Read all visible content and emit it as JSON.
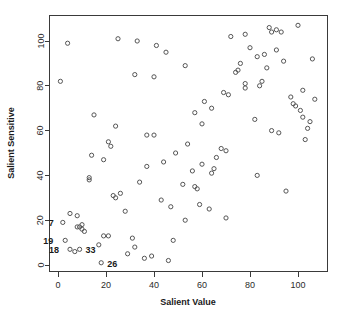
{
  "chart_data": {
    "type": "scatter",
    "title": "",
    "xlabel": "Salient Value",
    "ylabel": "Salient Sensitive",
    "xlim": [
      -4,
      112
    ],
    "ylim": [
      -4,
      112
    ],
    "xticks": [
      0,
      20,
      40,
      60,
      80,
      100
    ],
    "yticks": [
      0,
      20,
      40,
      60,
      80,
      100
    ],
    "xtick_labels": [
      "0",
      "20",
      "40",
      "60",
      "80",
      "100"
    ],
    "ytick_labels": [
      "0",
      "20",
      "40",
      "60",
      "80",
      "100"
    ],
    "grid": false,
    "legend": null,
    "marker": "open-circle",
    "marker_color": "#555555",
    "background_color": "#ffffff",
    "axis_color": "#3a3a3a",
    "points": [
      {
        "x": 1,
        "y": 82
      },
      {
        "x": 4,
        "y": 99
      },
      {
        "x": 2,
        "y": 19
      },
      {
        "x": 5,
        "y": 23
      },
      {
        "x": 8,
        "y": 22
      },
      {
        "x": 8,
        "y": 17
      },
      {
        "x": 9,
        "y": 17
      },
      {
        "x": 10,
        "y": 18
      },
      {
        "x": 10,
        "y": 16
      },
      {
        "x": 11,
        "y": 15
      },
      {
        "x": 3,
        "y": 11
      },
      {
        "x": 5,
        "y": 7
      },
      {
        "x": 7,
        "y": 6
      },
      {
        "x": 9,
        "y": 7
      },
      {
        "x": 14,
        "y": 49
      },
      {
        "x": 13,
        "y": 39
      },
      {
        "x": 13,
        "y": 38
      },
      {
        "x": 15,
        "y": 67
      },
      {
        "x": 17,
        "y": 9
      },
      {
        "x": 18,
        "y": 1
      },
      {
        "x": 19,
        "y": 47
      },
      {
        "x": 19,
        "y": 13
      },
      {
        "x": 21,
        "y": 13
      },
      {
        "x": 21,
        "y": 55
      },
      {
        "x": 22,
        "y": 53
      },
      {
        "x": 23,
        "y": 31
      },
      {
        "x": 24,
        "y": 30
      },
      {
        "x": 24,
        "y": 62
      },
      {
        "x": 25,
        "y": 101
      },
      {
        "x": 26,
        "y": 32
      },
      {
        "x": 28,
        "y": 24
      },
      {
        "x": 29,
        "y": 5
      },
      {
        "x": 31,
        "y": 12
      },
      {
        "x": 32,
        "y": 8
      },
      {
        "x": 32,
        "y": 85
      },
      {
        "x": 33,
        "y": 100
      },
      {
        "x": 34,
        "y": 37
      },
      {
        "x": 36,
        "y": 3
      },
      {
        "x": 37,
        "y": 58
      },
      {
        "x": 37,
        "y": 44
      },
      {
        "x": 39,
        "y": 4
      },
      {
        "x": 40,
        "y": 58
      },
      {
        "x": 40,
        "y": 84
      },
      {
        "x": 41,
        "y": 98
      },
      {
        "x": 43,
        "y": 29
      },
      {
        "x": 44,
        "y": 46
      },
      {
        "x": 45,
        "y": 95
      },
      {
        "x": 46,
        "y": 2
      },
      {
        "x": 47,
        "y": 26
      },
      {
        "x": 48,
        "y": 11
      },
      {
        "x": 49,
        "y": 50
      },
      {
        "x": 52,
        "y": 36
      },
      {
        "x": 53,
        "y": 20
      },
      {
        "x": 53,
        "y": 89
      },
      {
        "x": 54,
        "y": 54
      },
      {
        "x": 56,
        "y": 42
      },
      {
        "x": 57,
        "y": 35
      },
      {
        "x": 58,
        "y": 34
      },
      {
        "x": 57,
        "y": 68
      },
      {
        "x": 59,
        "y": 27
      },
      {
        "x": 60,
        "y": 63
      },
      {
        "x": 60,
        "y": 45
      },
      {
        "x": 61,
        "y": 73
      },
      {
        "x": 63,
        "y": 25
      },
      {
        "x": 64,
        "y": 41
      },
      {
        "x": 64,
        "y": 70
      },
      {
        "x": 65,
        "y": 43
      },
      {
        "x": 66,
        "y": 48
      },
      {
        "x": 68,
        "y": 52
      },
      {
        "x": 69,
        "y": 77
      },
      {
        "x": 70,
        "y": 21
      },
      {
        "x": 70,
        "y": 51
      },
      {
        "x": 71,
        "y": 76
      },
      {
        "x": 72,
        "y": 102
      },
      {
        "x": 74,
        "y": 86
      },
      {
        "x": 75,
        "y": 87
      },
      {
        "x": 76,
        "y": 90
      },
      {
        "x": 78,
        "y": 103
      },
      {
        "x": 78,
        "y": 81
      },
      {
        "x": 78,
        "y": 79
      },
      {
        "x": 80,
        "y": 97
      },
      {
        "x": 82,
        "y": 65
      },
      {
        "x": 83,
        "y": 40
      },
      {
        "x": 83,
        "y": 93
      },
      {
        "x": 84,
        "y": 80
      },
      {
        "x": 85,
        "y": 82
      },
      {
        "x": 86,
        "y": 94
      },
      {
        "x": 87,
        "y": 88
      },
      {
        "x": 88,
        "y": 106
      },
      {
        "x": 89,
        "y": 104
      },
      {
        "x": 89,
        "y": 60
      },
      {
        "x": 91,
        "y": 105
      },
      {
        "x": 91,
        "y": 96
      },
      {
        "x": 92,
        "y": 59
      },
      {
        "x": 93,
        "y": 104
      },
      {
        "x": 94,
        "y": 91
      },
      {
        "x": 95,
        "y": 33
      },
      {
        "x": 97,
        "y": 75
      },
      {
        "x": 98,
        "y": 72
      },
      {
        "x": 99,
        "y": 71
      },
      {
        "x": 100,
        "y": 107
      },
      {
        "x": 101,
        "y": 69
      },
      {
        "x": 102,
        "y": 78
      },
      {
        "x": 102,
        "y": 66
      },
      {
        "x": 103,
        "y": 56
      },
      {
        "x": 104,
        "y": 61
      },
      {
        "x": 105,
        "y": 64
      },
      {
        "x": 106,
        "y": 92
      },
      {
        "x": 107,
        "y": 74
      }
    ],
    "point_labels": [
      {
        "text": "7",
        "x": 2,
        "y": 19,
        "dx": -9,
        "dy": 1
      },
      {
        "text": "19",
        "x": 3,
        "y": 11,
        "dx": -12,
        "dy": 1
      },
      {
        "text": "18",
        "x": 5,
        "y": 7,
        "dx": -11,
        "dy": 1
      },
      {
        "text": "33",
        "x": 9,
        "y": 7,
        "dx": 6,
        "dy": 1
      },
      {
        "text": "26",
        "x": 18,
        "y": 1,
        "dx": 6,
        "dy": 1
      }
    ]
  }
}
